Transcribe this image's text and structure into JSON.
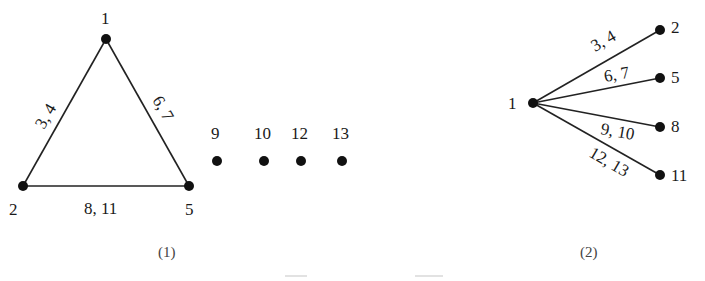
{
  "figure1": {
    "caption": "(1)",
    "nodes": [
      {
        "id": "1",
        "label": "1"
      },
      {
        "id": "2",
        "label": "2"
      },
      {
        "id": "5",
        "label": "5"
      }
    ],
    "edges": [
      {
        "from": "1",
        "to": "2",
        "label": "3,  4"
      },
      {
        "from": "1",
        "to": "5",
        "label": "6,  7"
      },
      {
        "from": "2",
        "to": "5",
        "label": "8,  11"
      }
    ],
    "isolated_nodes": [
      {
        "id": "9",
        "label": "9"
      },
      {
        "id": "10",
        "label": "10"
      },
      {
        "id": "12",
        "label": "12"
      },
      {
        "id": "13",
        "label": "13"
      }
    ]
  },
  "figure2": {
    "caption": "(2)",
    "center": {
      "id": "1",
      "label": "1"
    },
    "leaves": [
      {
        "id": "2",
        "label": "2",
        "edge_label": "3,  4"
      },
      {
        "id": "5",
        "label": "5",
        "edge_label": "6,  7"
      },
      {
        "id": "8",
        "label": "8",
        "edge_label": "9,  10"
      },
      {
        "id": "11",
        "label": "11",
        "edge_label": "12,  13"
      }
    ]
  }
}
